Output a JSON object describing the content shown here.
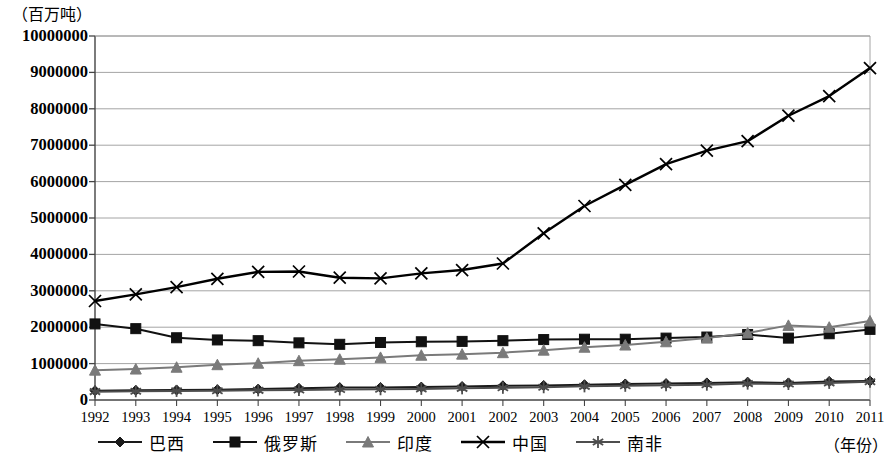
{
  "axes": {
    "y_unit_label": "（百万吨）",
    "x_axis_title": "（年份）",
    "y_ticks": [
      "0",
      "1000000",
      "2000000",
      "3000000",
      "4000000",
      "5000000",
      "6000000",
      "7000000",
      "8000000",
      "9000000",
      "10000000"
    ],
    "x_ticks": [
      "1992",
      "1993",
      "1994",
      "1995",
      "1996",
      "1997",
      "1998",
      "1999",
      "2000",
      "2001",
      "2002",
      "2003",
      "2004",
      "2005",
      "2006",
      "2007",
      "2008",
      "2009",
      "2010",
      "2011"
    ]
  },
  "legend": {
    "items": [
      {
        "label": "巴西",
        "marker": "diamond-marker",
        "color": "#1a1a1a"
      },
      {
        "label": "俄罗斯",
        "marker": "square-marker",
        "color": "#111111"
      },
      {
        "label": "印度",
        "marker": "triangle-marker",
        "color": "#7a7a7a"
      },
      {
        "label": "中国",
        "marker": "x-cross-marker",
        "color": "#000000"
      },
      {
        "label": "南非",
        "marker": "asterisk-marker",
        "color": "#4d4d4d"
      }
    ]
  },
  "chart_data": {
    "type": "line",
    "title": "",
    "xlabel": "（年份）",
    "ylabel": "（百万吨）",
    "xlim": [
      1992,
      2011
    ],
    "ylim": [
      0,
      10000000
    ],
    "ytick_step": 1000000,
    "grid": true,
    "legend_position": "bottom",
    "categories": [
      1992,
      1993,
      1994,
      1995,
      1996,
      1997,
      1998,
      1999,
      2000,
      2001,
      2002,
      2003,
      2004,
      2005,
      2006,
      2007,
      2008,
      2009,
      2010,
      2011
    ],
    "series": [
      {
        "name": "巴西",
        "marker": "diamond-marker",
        "color": "#1a1a1a",
        "values": [
          255000,
          265000,
          275000,
          285000,
          300000,
          320000,
          340000,
          345000,
          355000,
          370000,
          390000,
          400000,
          420000,
          440000,
          450000,
          470000,
          490000,
          470000,
          510000,
          520000
        ]
      },
      {
        "name": "俄罗斯",
        "marker": "square-marker",
        "color": "#111111",
        "values": [
          2090000,
          1960000,
          1710000,
          1650000,
          1630000,
          1570000,
          1530000,
          1580000,
          1600000,
          1610000,
          1630000,
          1660000,
          1670000,
          1670000,
          1700000,
          1730000,
          1800000,
          1700000,
          1820000,
          1940000
        ]
      },
      {
        "name": "印度",
        "marker": "triangle-marker",
        "color": "#7a7a7a",
        "values": [
          820000,
          850000,
          900000,
          970000,
          1010000,
          1080000,
          1120000,
          1170000,
          1230000,
          1260000,
          1300000,
          1370000,
          1450000,
          1510000,
          1600000,
          1700000,
          1840000,
          2050000,
          2000000,
          2170000
        ]
      },
      {
        "name": "中国",
        "marker": "x-cross-marker",
        "color": "#000000",
        "values": [
          2720000,
          2900000,
          3100000,
          3330000,
          3520000,
          3530000,
          3360000,
          3340000,
          3480000,
          3570000,
          3750000,
          4580000,
          5330000,
          5910000,
          6480000,
          6850000,
          7110000,
          7810000,
          8350000,
          9120000
        ]
      },
      {
        "name": "南非",
        "marker": "asterisk-marker",
        "color": "#4d4d4d",
        "values": [
          230000,
          240000,
          250000,
          255000,
          265000,
          275000,
          290000,
          295000,
          305000,
          320000,
          335000,
          350000,
          375000,
          390000,
          405000,
          420000,
          450000,
          440000,
          470000,
          500000
        ]
      }
    ]
  }
}
